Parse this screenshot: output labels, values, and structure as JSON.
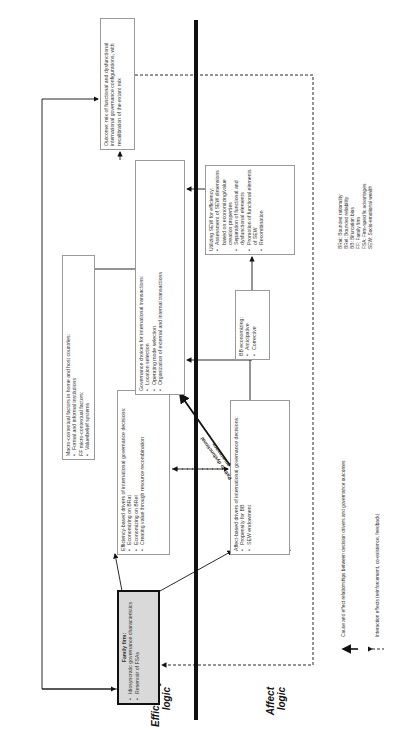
{
  "labels": {
    "efficiency_logic": [
      "Efficiency",
      "logic"
    ],
    "affect_logic": [
      "Affect",
      "logic"
    ]
  },
  "boxes": {
    "family_firm": {
      "title": "Family firm:",
      "items": [
        "Idiosyncratic governance characteristics",
        "Reservoir of FSAs"
      ]
    },
    "efficiency_drivers": {
      "title": "Efficiency-based drivers of international governance decisions:",
      "items": [
        "Economizing on BRat",
        "Economizing on BRel",
        "Creating value through resource recombination"
      ]
    },
    "macro_context": {
      "title": "Macro-contextual factors in home and host countries:",
      "items": [
        "Formal and informal institutions"
      ],
      "subtitle": "FF micro-contextual factors:",
      "subitems": [
        "Value/belief systems"
      ]
    },
    "governance_choices": {
      "title": "Governance choices for international transactions:",
      "items": [
        "Location selection",
        "Operating mode selection",
        "Organization of external and internal transactions"
      ]
    },
    "outcome": {
      "title": "Outcome: mix of functional and dysfunctional international governance configurations, with recalibration of the extant mix"
    },
    "affect_drivers": {
      "title": "Affect-based drivers of international governance decisions:",
      "items": [
        "Propensity for BB",
        "SEW endowment"
      ]
    },
    "bb_economizing": {
      "title": "BB economizing:",
      "items": [
        "Anticipative",
        "Corrective"
      ]
    },
    "sew_efficiency": {
      "title": "Utilizing SEW for efficiency:",
      "items": [
        "Assessment of SEW dimensions based on economizing/value creation properties",
        "Separation of functional and dysfunctional elements",
        "Promotion of functional elements of SEW",
        "Recombination"
      ]
    }
  },
  "path_label": [
    "Path to dysfunctional",
    "governance"
  ],
  "legend": {
    "solid": "Cause and effect relationships between decision drivers and governance outcomes",
    "dashed": "Interaction effects (reinforcement, co-existence, feedback)"
  },
  "abbreviations": [
    "BRat: Bounded rationality",
    "BRel: Bounded reliability",
    "BB: Bifurcation bias",
    "FF: Family firm",
    "FSA: Firm-specific advantages",
    "SEW: Socio-emotional wealth"
  ],
  "colors": {
    "line": "#111111",
    "box_border": "#9a9a9a",
    "family_fill": "#d9d9d9"
  }
}
